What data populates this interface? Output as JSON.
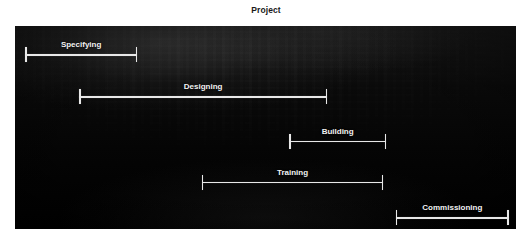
{
  "chart_title": "Project",
  "colors": {
    "panel_background": "#000000",
    "bar": "#e8e8e8",
    "label_text": "#f2f2f2",
    "title_text": "#1a1a1a",
    "page_background": "#ffffff"
  },
  "chart_data": {
    "type": "bar",
    "subtype": "gantt",
    "title": "Project",
    "xlabel": "",
    "ylabel": "",
    "grid": false,
    "legend": "none",
    "categories": [
      "Specifying",
      "Designing",
      "Building",
      "Training",
      "Commissioning"
    ],
    "xlim": [
      0,
      100
    ],
    "tasks": [
      {
        "name": "Specifying",
        "label": "Specifying",
        "start": 2.0,
        "end": 24.4,
        "row": 0
      },
      {
        "name": "Designing",
        "label": "Designing",
        "start": 12.8,
        "end": 62.3,
        "row": 1
      },
      {
        "name": "Building",
        "label": "Building",
        "start": 54.7,
        "end": 74.1,
        "row": 2
      },
      {
        "name": "Training",
        "label": "Training",
        "start": 37.3,
        "end": 73.5,
        "row": 3
      },
      {
        "name": "Commissioning",
        "label": "Commissioning",
        "start": 76.0,
        "end": 98.6,
        "row": 4
      }
    ],
    "rows": [
      {
        "label": "Specifying",
        "y_fraction": 0.138
      },
      {
        "label": "Designing",
        "y_fraction": 0.345
      },
      {
        "label": "Building",
        "y_fraction": 0.566
      },
      {
        "label": "Training",
        "y_fraction": 0.768
      },
      {
        "label": "Commissioning",
        "y_fraction": 0.941
      }
    ]
  },
  "plot_area": {
    "left": 15,
    "top": 26,
    "width": 501,
    "height": 203
  }
}
